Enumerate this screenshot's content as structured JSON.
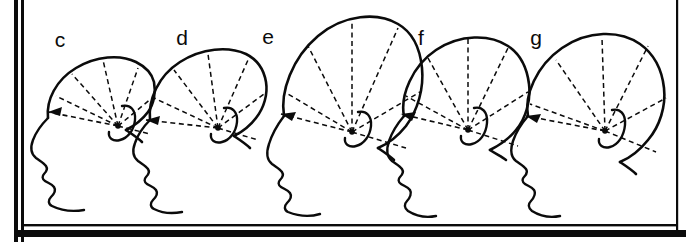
{
  "figure": {
    "kind": "anthropometric-head-profile-series",
    "background_color": "#ffffff",
    "ink_color": "#0b0b0b",
    "width": 686,
    "height": 242,
    "frame": {
      "left_bar_label": "left-border-bar",
      "bottom_bar_label": "bottom-border-bar",
      "right_rule_label": "right-border-rule",
      "left_bar_x": 14,
      "left_bar_width": 9,
      "bottom_bar_y": 228,
      "bottom_bar_height": 8,
      "right_rule_x": 676,
      "inner_rule_inset": 5
    }
  },
  "panels": [
    {
      "id": "panel-c",
      "label": "c",
      "label_x": 60,
      "label_y": 47,
      "vertex_x": 118,
      "vertex_y": 126,
      "skull_height_rank": 1,
      "radial_count": 5,
      "baseline_arrow_x": 52,
      "baseline_arrow_y": 113
    },
    {
      "id": "panel-d",
      "label": "d",
      "label_x": 182,
      "label_y": 45,
      "vertex_x": 218,
      "vertex_y": 128,
      "skull_height_rank": 3,
      "radial_count": 5,
      "baseline_arrow_x": 150,
      "baseline_arrow_y": 122
    },
    {
      "id": "panel-e",
      "label": "e",
      "label_x": 268,
      "label_y": 44,
      "vertex_x": 352,
      "vertex_y": 132,
      "skull_height_rank": 5,
      "radial_count": 5,
      "baseline_arrow_x": 285,
      "baseline_arrow_y": 117
    },
    {
      "id": "panel-f",
      "label": "f",
      "label_x": 421,
      "label_y": 45,
      "vertex_x": 468,
      "vertex_y": 130,
      "skull_height_rank": 4,
      "radial_count": 5,
      "baseline_arrow_x": 405,
      "baseline_arrow_y": 117
    },
    {
      "id": "panel-g",
      "label": "g",
      "label_x": 536,
      "label_y": 45,
      "vertex_x": 605,
      "vertex_y": 131,
      "skull_height_rank": 2,
      "radial_count": 5,
      "baseline_arrow_x": 530,
      "baseline_arrow_y": 119
    }
  ],
  "annotations": {
    "radial_fan_name": "radial-measurement-fan",
    "baseline_name": "horizontal-reference-baseline",
    "vertex_name": "fan-vertex-point",
    "arrow_name": "baseline-arrowhead",
    "ear_name": "ear-outline",
    "skull_name": "skull-outline",
    "face_name": "face-profile-outline"
  }
}
